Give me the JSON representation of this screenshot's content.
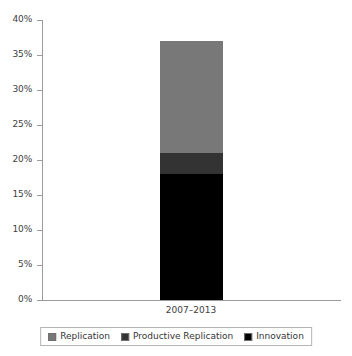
{
  "chart_data": {
    "type": "bar",
    "subtype": "stacked-column",
    "title": "",
    "xlabel": "",
    "ylabel": "",
    "categories": [
      "2007–2013"
    ],
    "series": [
      {
        "name": "Innovation",
        "values": [
          18
        ],
        "color": "#000000",
        "stack_order": 0
      },
      {
        "name": "Productive Replication",
        "values": [
          3
        ],
        "color": "#333333",
        "stack_order": 1
      },
      {
        "name": "Replication",
        "values": [
          16
        ],
        "color": "#787878",
        "stack_order": 2
      }
    ],
    "stack_totals": [
      37
    ],
    "ylim": [
      0,
      40
    ],
    "yticks": [
      0,
      5,
      10,
      15,
      20,
      25,
      30,
      35,
      40
    ],
    "ytick_labels": [
      "0%",
      "5%",
      "10%",
      "15%",
      "20%",
      "25%",
      "30%",
      "35%",
      "40%"
    ],
    "value_unit": "%",
    "grid": false,
    "legend_position": "bottom",
    "legend_order": [
      "Replication",
      "Productive Replication",
      "Innovation"
    ]
  },
  "axis": {
    "y_tick_labels": [
      "40%",
      "35%",
      "30%",
      "25%",
      "20%",
      "15%",
      "10%",
      "5%",
      "0%"
    ],
    "x_category_label": "2007–2013"
  },
  "legend": {
    "items": [
      {
        "label": "Replication",
        "color": "#787878"
      },
      {
        "label": "Productive Replication",
        "color": "#333333"
      },
      {
        "label": "Innovation",
        "color": "#000000"
      }
    ]
  },
  "colors": {
    "background": "#ffffff",
    "axis_line": "#9a9a9a",
    "text": "#404040",
    "replication": "#787878",
    "productive_replication": "#333333",
    "innovation": "#000000"
  }
}
